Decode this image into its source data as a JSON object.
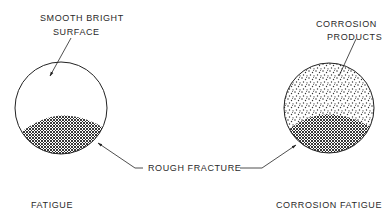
{
  "diagram": {
    "type": "comparison-illustration",
    "panels": [
      {
        "id": "fatigue",
        "caption": "FATIGUE",
        "callout_top": {
          "line1": "SMOOTH BRIGHT",
          "line2": "SURFACE"
        },
        "regions": [
          {
            "name": "smooth-bright-surface",
            "fill": "blank"
          },
          {
            "name": "rough-fracture",
            "fill": "crosshatch"
          }
        ]
      },
      {
        "id": "corrosion-fatigue",
        "caption": "CORROSION FATIGUE",
        "callout_top": {
          "line1": "CORROSION",
          "line2": "PRODUCTS"
        },
        "regions": [
          {
            "name": "corrosion-products",
            "fill": "stipple"
          },
          {
            "name": "rough-fracture",
            "fill": "crosshatch"
          }
        ]
      }
    ],
    "shared_callout": "ROUGH FRACTURE"
  },
  "colors": {
    "ink": "#2a2a2a",
    "background": "#ffffff"
  }
}
